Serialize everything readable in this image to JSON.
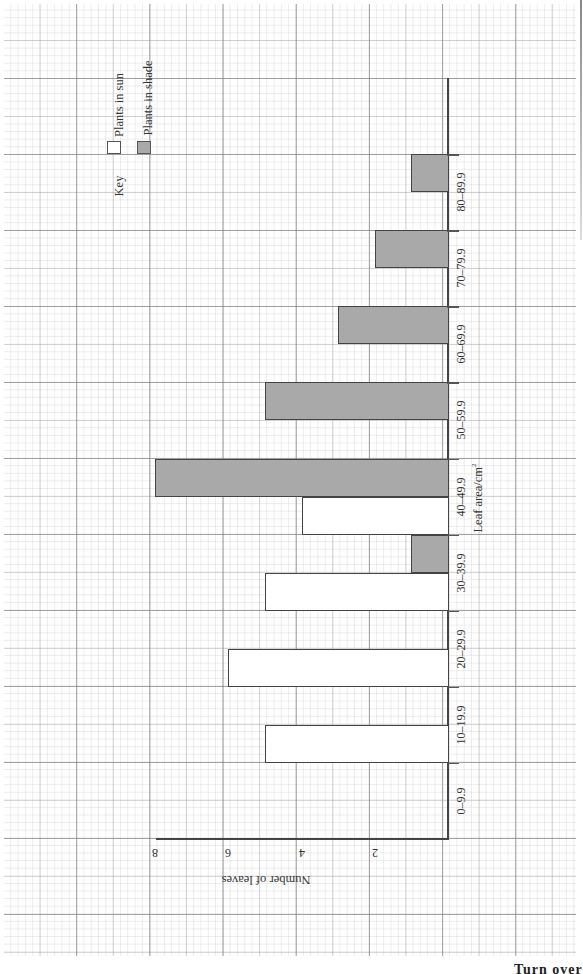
{
  "chart_data": {
    "type": "bar",
    "orientation": "rotated 90° (page in landscape; categories run along vertical, counts along horizontal)",
    "title": "",
    "xlabel": "Leaf area/cm²",
    "ylabel": "Number of leaves",
    "categories": [
      "0–9.9",
      "10–19.9",
      "20–29.9",
      "30–39.9",
      "40–49.9",
      "50–59.9",
      "60–69.9",
      "70–79.9",
      "80–89.9"
    ],
    "series": [
      {
        "name": "Plants in sun",
        "fill": "#ffffff",
        "values": [
          0,
          5,
          6,
          5,
          4,
          0,
          0,
          0,
          0
        ]
      },
      {
        "name": "Plants in shade",
        "fill": "#a9a9a9",
        "values": [
          0,
          0,
          0,
          1,
          8,
          5,
          3,
          2,
          1
        ]
      }
    ],
    "y_ticks": [
      "2",
      "4",
      "6",
      "8"
    ],
    "ylim": [
      0,
      8
    ],
    "grid": true,
    "legend": {
      "title": "Key",
      "position": "top-left (rotated)"
    }
  },
  "axes": {
    "xlabel": "Leaf area/cm",
    "xlabel_sup": "2",
    "ylabel": "Number of leaves",
    "ticks": [
      "2",
      "4",
      "6",
      "8"
    ]
  },
  "legend": {
    "title": "Key",
    "items": [
      {
        "label": "Plants in sun"
      },
      {
        "label": "Plants in shade"
      }
    ]
  },
  "footer": {
    "turn_over": "Turn over"
  }
}
